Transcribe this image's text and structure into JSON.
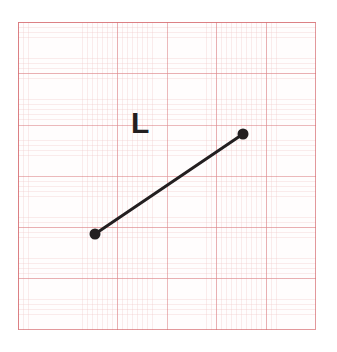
{
  "figure": {
    "kind": "geometry-diagram",
    "background": "graph-paper",
    "label": "L",
    "label_color": "#231f20",
    "stroke_color": "#231f20",
    "grid_line_color": "#d66c70",
    "grid_fine_color": "#e29696",
    "paper_color": "#fffdfd",
    "page_color": "#ffffff"
  },
  "geometry": {
    "canvas": {
      "width": 337,
      "height": 352
    },
    "grid_panel": {
      "x": 18,
      "y": 22,
      "width": 298,
      "height": 308
    },
    "grid_spacing_minor_px": 4.96,
    "grid_spacing_major_px": 49.6,
    "segment": {
      "name": "L",
      "stroke_width_px": 3,
      "endpoints": [
        {
          "name": "endpoint-left",
          "x": 95,
          "y": 234,
          "dot_radius_px": 5.5
        },
        {
          "name": "endpoint-right",
          "x": 243,
          "y": 134,
          "dot_radius_px": 5.5
        }
      ]
    },
    "label_position": {
      "x": 131,
      "y": 108
    }
  },
  "chart_data": {
    "type": "scatter",
    "title": "",
    "xlabel": "",
    "ylabel": "",
    "grid": true,
    "legend": false,
    "annotations": [
      {
        "text": "L",
        "x": 131,
        "y": 108
      }
    ],
    "series": [
      {
        "name": "L",
        "x": [
          95,
          243
        ],
        "y": [
          234,
          134
        ]
      }
    ]
  }
}
